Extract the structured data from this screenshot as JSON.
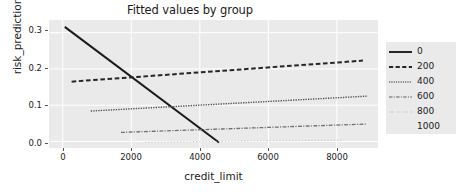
{
  "chart_data": {
    "type": "line",
    "title": "Fitted values by group",
    "xlabel": "credit_limit",
    "ylabel": "risk_prediction",
    "xlim": [
      -400,
      9200
    ],
    "ylim": [
      -0.018,
      0.335
    ],
    "xticks": [
      0,
      2000,
      4000,
      6000,
      8000
    ],
    "xtick_labels": [
      "0",
      "2000",
      "4000",
      "6000",
      "8000"
    ],
    "yticks": [
      0.0,
      0.1,
      0.2,
      0.3
    ],
    "ytick_labels": [
      "0.0",
      "0.1",
      "0.2",
      "0.3"
    ],
    "grid": true,
    "grid_color": "#ffffff",
    "plot_background": "#eaeaea",
    "legend_position": "right",
    "legend_title": "",
    "series": [
      {
        "name": "0",
        "linestyle": "solid",
        "color": "#1b1b1b",
        "x": [
          60,
          4560
        ],
        "y": [
          0.316,
          -0.003
        ]
      },
      {
        "name": "200",
        "linestyle": "dashed",
        "color": "#262626",
        "x": [
          260,
          8760
        ],
        "y": [
          0.165,
          0.223
        ]
      },
      {
        "name": "400",
        "linestyle": "dotted",
        "color": "#4f4f4f",
        "x": [
          820,
          8880
        ],
        "y": [
          0.084,
          0.125
        ]
      },
      {
        "name": "600",
        "linestyle": "dashdot",
        "color": "#6e6e6e",
        "x": [
          1700,
          8860
        ],
        "y": [
          0.025,
          0.048
        ]
      },
      {
        "name": "800",
        "linestyle": "dotted-fine",
        "color": "#c2c2c2",
        "x": [
          2400,
          8200
        ],
        "y": [
          -0.002,
          0.004
        ]
      },
      {
        "name": "1000",
        "linestyle": "none",
        "color": "#e0e0e0",
        "x": [],
        "y": []
      }
    ]
  }
}
